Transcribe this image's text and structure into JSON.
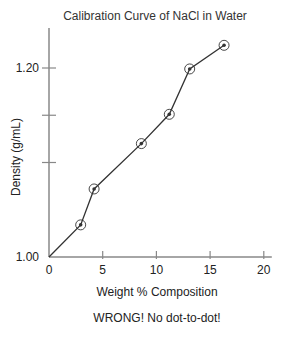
{
  "chart_data": {
    "type": "line",
    "title": "Calibration Curve of NaCl in Water",
    "xlabel": "Weight % Composition",
    "ylabel": "Density (g/mL)",
    "caption": "WRONG! No dot-to-dot!",
    "xlim": [
      0,
      20
    ],
    "ylim": [
      1.0,
      1.24
    ],
    "x_ticks": [
      0,
      5,
      10,
      15,
      20
    ],
    "x_tick_labels": [
      "0",
      "5",
      "10",
      "15",
      "20"
    ],
    "y_ticks": [
      1.0,
      1.1,
      1.15,
      1.2
    ],
    "y_tick_labels": [
      "1.00",
      "",
      "",
      "1.20"
    ],
    "grid": false,
    "legend": null,
    "line_starts_at_origin": true,
    "series": [
      {
        "name": "NaCl density",
        "marker": "circled-dot",
        "x": [
          2.95,
          4.2,
          8.6,
          11.2,
          13.1,
          16.3
        ],
        "y": [
          1.034,
          1.072,
          1.12,
          1.151,
          1.199,
          1.224
        ]
      }
    ]
  },
  "colors": {
    "axis": "#888888",
    "line": "#333333",
    "marker": "#333333"
  }
}
